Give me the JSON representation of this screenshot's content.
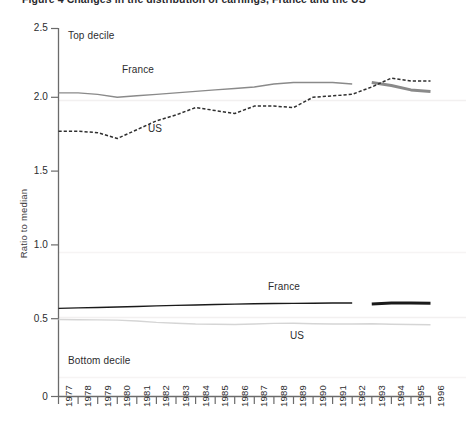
{
  "figure": {
    "title": "Figure 4  Changes in the distribution of earnings, France and the US",
    "region_labels": {
      "top": "Top decile",
      "bottom": "Bottom decile"
    },
    "series_annotations": [
      {
        "text": "France",
        "x": 139,
        "y": 71
      },
      {
        "text": "US",
        "x": 150,
        "y": 131
      },
      {
        "text": "France",
        "x": 270,
        "y": 288
      },
      {
        "text": "US",
        "x": 292,
        "y": 337
      }
    ],
    "colors": {
      "france_top": "#8a8a8a",
      "us_top": "#2f2f2f",
      "france_bottom": "#1a1a1a",
      "us_bottom": "#d5d5d5",
      "axis": "#6b6b6b",
      "gridline": "#f0eeee",
      "text": "#2c2c2e"
    }
  },
  "chart_data": {
    "type": "line",
    "title": "Figure 4  Changes in the distribution of earnings, France and the US",
    "xlabel": "",
    "ylabel": "Ratio to median",
    "ylim": [
      0,
      2.5
    ],
    "yticks": [
      "0",
      "0.5",
      "1.0",
      "1.5",
      "2.0",
      "2.5"
    ],
    "ytick_values": [
      0,
      0.5,
      1.0,
      1.5,
      2.0,
      2.5
    ],
    "grid": "faint-horizontal",
    "legend": "inline-annotations",
    "x": [
      1977,
      1978,
      1979,
      1980,
      1981,
      1982,
      1983,
      1984,
      1985,
      1986,
      1987,
      1988,
      1989,
      1990,
      1991,
      1992,
      1993,
      1994,
      1995,
      1996
    ],
    "xtick_labels": [
      "1977",
      "1978",
      "1979",
      "1980",
      "1981",
      "1982",
      "1983",
      "1984",
      "1985",
      "1986",
      "1987",
      "1988",
      "1989",
      "1990",
      "1991",
      "1992",
      "1993",
      "1994",
      "1995",
      "1996"
    ],
    "series": [
      {
        "name": "France top decile",
        "group": "Top decile",
        "country": "France",
        "style": "solid",
        "color": "#8a8a8a",
        "segments": [
          {
            "x": [
              1977,
              1978,
              1979,
              1980,
              1981,
              1982,
              1983,
              1984,
              1985,
              1986,
              1987,
              1988,
              1989,
              1990,
              1991,
              1992
            ],
            "values": [
              2.06,
              2.06,
              2.05,
              2.03,
              2.04,
              2.05,
              2.06,
              2.07,
              2.08,
              2.09,
              2.1,
              2.12,
              2.13,
              2.13,
              2.13,
              2.12
            ]
          },
          {
            "x": [
              1993,
              1994,
              1995,
              1996
            ],
            "values": [
              2.13,
              2.11,
              2.08,
              2.07
            ],
            "width": "thick"
          }
        ]
      },
      {
        "name": "US top decile",
        "group": "Top decile",
        "country": "US",
        "style": "dashed",
        "color": "#2f2f2f",
        "segments": [
          {
            "x": [
              1977,
              1978,
              1979,
              1980,
              1981,
              1982,
              1983,
              1984,
              1985,
              1986,
              1987,
              1988,
              1989,
              1990,
              1991,
              1992,
              1993,
              1994,
              1995,
              1996
            ],
            "values": [
              1.8,
              1.8,
              1.79,
              1.75,
              1.81,
              1.87,
              1.91,
              1.96,
              1.94,
              1.92,
              1.97,
              1.97,
              1.96,
              2.03,
              2.04,
              2.05,
              2.1,
              2.16,
              2.14,
              2.14
            ]
          }
        ]
      },
      {
        "name": "France bottom decile",
        "group": "Bottom decile",
        "country": "France",
        "style": "solid",
        "color": "#1a1a1a",
        "segments": [
          {
            "x": [
              1977,
              1978,
              1979,
              1980,
              1981,
              1982,
              1983,
              1984,
              1985,
              1986,
              1987,
              1988,
              1989,
              1990,
              1991,
              1992
            ],
            "values": [
              0.598,
              0.601,
              0.604,
              0.607,
              0.611,
              0.615,
              0.618,
              0.621,
              0.624,
              0.627,
              0.629,
              0.631,
              0.632,
              0.633,
              0.634,
              0.634
            ]
          },
          {
            "x": [
              1993,
              1994,
              1995,
              1996
            ],
            "values": [
              0.628,
              0.634,
              0.634,
              0.633
            ],
            "width": "thick"
          }
        ]
      },
      {
        "name": "US bottom decile",
        "group": "Bottom decile",
        "country": "US",
        "style": "solid",
        "color": "#d5d5d5",
        "segments": [
          {
            "x": [
              1977,
              1978,
              1979,
              1980,
              1981,
              1982,
              1983,
              1984,
              1985,
              1986,
              1987,
              1988,
              1989,
              1990,
              1991,
              1992,
              1993,
              1994,
              1995,
              1996
            ],
            "values": [
              0.522,
              0.521,
              0.52,
              0.518,
              0.512,
              0.503,
              0.497,
              0.492,
              0.49,
              0.488,
              0.492,
              0.496,
              0.497,
              0.494,
              0.492,
              0.492,
              0.494,
              0.49,
              0.488,
              0.487
            ]
          }
        ]
      }
    ]
  }
}
